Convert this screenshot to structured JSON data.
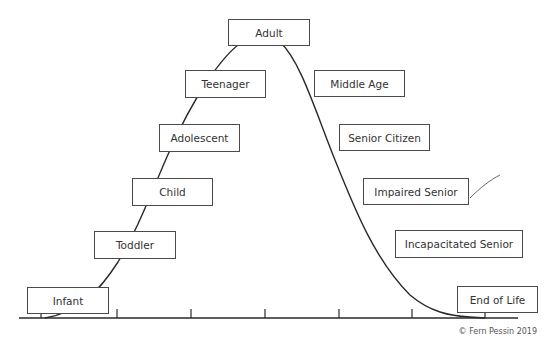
{
  "diagram": {
    "stages": [
      {
        "label": "Infant",
        "x": 27,
        "y": 287,
        "w": 82,
        "h": 27
      },
      {
        "label": "Toddler",
        "x": 94,
        "y": 231,
        "w": 82,
        "h": 28
      },
      {
        "label": "Child",
        "x": 132,
        "y": 178,
        "w": 81,
        "h": 28
      },
      {
        "label": "Adolescent",
        "x": 159,
        "y": 124,
        "w": 81,
        "h": 28
      },
      {
        "label": "Teenager",
        "x": 185,
        "y": 70,
        "w": 81,
        "h": 28
      },
      {
        "label": "Adult",
        "x": 228,
        "y": 19,
        "w": 82,
        "h": 27
      },
      {
        "label": "Middle Age",
        "x": 314,
        "y": 70,
        "w": 91,
        "h": 27
      },
      {
        "label": "Senior Citizen",
        "x": 339,
        "y": 124,
        "w": 91,
        "h": 27
      },
      {
        "label": "Impaired Senior",
        "x": 363,
        "y": 178,
        "w": 106,
        "h": 27
      },
      {
        "label": "Incapacitated Senior",
        "x": 395,
        "y": 230,
        "w": 128,
        "h": 28
      },
      {
        "label": "End of Life",
        "x": 457,
        "y": 286,
        "w": 81,
        "h": 27
      }
    ],
    "axis": {
      "y": 318,
      "x_start": 19,
      "x_end": 518,
      "ticks": [
        41,
        117,
        191,
        265,
        339,
        412,
        485
      ]
    },
    "copyright": "© Fern Pessin 2019",
    "colors": {
      "line": "#2a2a2a",
      "box_border": "#4a4a4a",
      "text": "#333333"
    }
  }
}
